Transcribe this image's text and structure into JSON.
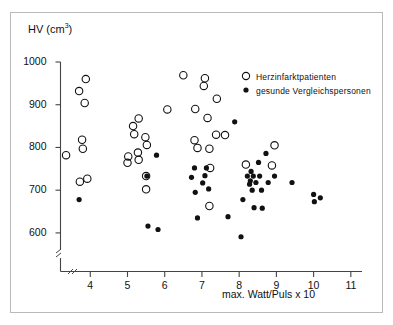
{
  "chart_data": {
    "type": "scatter",
    "title": "",
    "ylabel": "HV (cm3)",
    "ylabel_base": "HV (cm",
    "ylabel_exp": "3",
    "ylabel_close": ")",
    "xlabel": "max. Watt/Puls x 10",
    "xlim": [
      3.2,
      11.3
    ],
    "ylim": [
      560,
      1000
    ],
    "xticks": [
      4,
      5,
      6,
      7,
      8,
      9,
      10,
      11
    ],
    "yticks": [
      600,
      700,
      800,
      900,
      1000
    ],
    "axis_break_x": true,
    "axis_break_y": true,
    "grid": false,
    "legend_position": "top-right",
    "series": [
      {
        "name": "Herzinfarktpatienten",
        "marker": "open-circle",
        "color": "#111111",
        "points": [
          [
            3.35,
            782
          ],
          [
            3.7,
            932
          ],
          [
            3.88,
            960
          ],
          [
            3.85,
            904
          ],
          [
            3.78,
            818
          ],
          [
            3.8,
            797
          ],
          [
            3.72,
            720
          ],
          [
            3.92,
            727
          ],
          [
            5.02,
            779
          ],
          [
            5.0,
            764
          ],
          [
            5.15,
            850
          ],
          [
            5.18,
            831
          ],
          [
            5.3,
            868
          ],
          [
            5.28,
            788
          ],
          [
            5.3,
            771
          ],
          [
            5.48,
            824
          ],
          [
            5.52,
            806
          ],
          [
            5.5,
            733
          ],
          [
            5.5,
            702
          ],
          [
            6.07,
            889
          ],
          [
            6.5,
            969
          ],
          [
            6.82,
            890
          ],
          [
            6.8,
            817
          ],
          [
            6.88,
            799
          ],
          [
            7.08,
            962
          ],
          [
            7.05,
            944
          ],
          [
            7.15,
            869
          ],
          [
            7.2,
            797
          ],
          [
            7.22,
            752
          ],
          [
            7.2,
            663
          ],
          [
            7.4,
            914
          ],
          [
            7.38,
            830
          ],
          [
            7.62,
            829
          ],
          [
            8.18,
            760
          ],
          [
            8.88,
            758
          ],
          [
            8.95,
            805
          ]
        ]
      },
      {
        "name": "gesunde Vergleichspersonen",
        "marker": "filled-circle",
        "color": "#111111",
        "points": [
          [
            3.7,
            678
          ],
          [
            5.52,
            733
          ],
          [
            5.55,
            616
          ],
          [
            5.78,
            782
          ],
          [
            5.82,
            608
          ],
          [
            6.72,
            730
          ],
          [
            6.8,
            752
          ],
          [
            6.82,
            695
          ],
          [
            6.88,
            635
          ],
          [
            7.02,
            717
          ],
          [
            7.08,
            734
          ],
          [
            7.18,
            703
          ],
          [
            7.12,
            752
          ],
          [
            7.7,
            638
          ],
          [
            7.88,
            860
          ],
          [
            8.05,
            591
          ],
          [
            8.1,
            678
          ],
          [
            8.22,
            733
          ],
          [
            8.3,
            722
          ],
          [
            8.32,
            744
          ],
          [
            8.28,
            714
          ],
          [
            8.35,
            700
          ],
          [
            8.4,
            659
          ],
          [
            8.38,
            733
          ],
          [
            8.45,
            718
          ],
          [
            8.52,
            765
          ],
          [
            8.55,
            733
          ],
          [
            8.6,
            700
          ],
          [
            8.62,
            658
          ],
          [
            8.72,
            786
          ],
          [
            8.78,
            718
          ],
          [
            8.95,
            733
          ],
          [
            9.42,
            718
          ],
          [
            10.0,
            690
          ],
          [
            10.02,
            673
          ],
          [
            10.18,
            682
          ]
        ]
      }
    ]
  },
  "legend": {
    "entries": [
      {
        "label": "Herzinfarktpatienten",
        "marker": "open-circle"
      },
      {
        "label": "gesunde Vergleichspersonen",
        "marker": "filled-circle"
      }
    ]
  }
}
